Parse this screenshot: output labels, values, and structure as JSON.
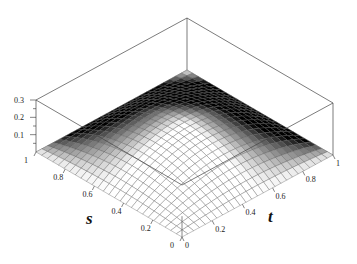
{
  "chart_data": {
    "type": "surface3d",
    "title": "",
    "xlabel": "s",
    "ylabel": "t",
    "zlabel": "",
    "x_ticks": [
      "0",
      "0.2",
      "0.4",
      "0.6",
      "0.8",
      "1"
    ],
    "y_ticks": [
      "0",
      "0.2",
      "0.4",
      "0.6",
      "0.8",
      "1"
    ],
    "z_ticks": [
      "0.1",
      "0.2",
      "0.3"
    ],
    "xlim": [
      0,
      1
    ],
    "ylim": [
      0,
      1
    ],
    "zlim": [
      0,
      0.3
    ],
    "surface": "dome-shaped surface, zero on all edges, max approx 0.18 at center (s=0.5, t=0.5)",
    "peak": {
      "s": 0.5,
      "t": 0.5,
      "z": 0.18
    },
    "grid": true,
    "legend": "none",
    "colormap": "grayscale shading"
  }
}
